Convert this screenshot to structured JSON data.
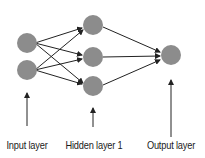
{
  "diagram": {
    "type": "feedforward-neural-network",
    "node_color": "#8c8c8c",
    "edge_color": "#222222",
    "layers": [
      {
        "name": "input",
        "label": "Input layer",
        "x": 27,
        "nodes": [
          43,
          70
        ]
      },
      {
        "name": "hidden",
        "label": "Hidden layer 1",
        "x": 93,
        "nodes": [
          25,
          57,
          86
        ]
      },
      {
        "name": "output",
        "label": "Output layer",
        "x": 171,
        "nodes": [
          55
        ]
      }
    ],
    "connections": "fully-connected input→hidden→output"
  },
  "labels": {
    "input": "Input layer",
    "hidden": "Hidden layer 1",
    "output": "Output layer"
  }
}
